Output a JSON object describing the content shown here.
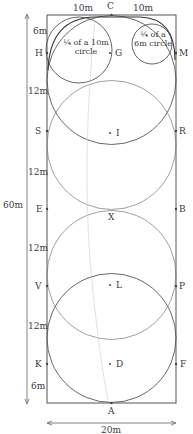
{
  "diagram": {
    "arena": {
      "width_label": "20m",
      "length_label": "60m"
    },
    "top_segments": [
      "10m",
      "10m"
    ],
    "segment_labels": [
      "6m",
      "12m",
      "12m",
      "12m",
      "12m",
      "6m"
    ],
    "letters": {
      "C": "C",
      "H": "H",
      "M": "M",
      "G": "G",
      "S": "S",
      "R": "R",
      "I": "I",
      "E": "E",
      "B": "B",
      "X": "X",
      "V": "V",
      "P": "P",
      "L": "L",
      "K": "K",
      "F": "F",
      "D": "D",
      "A": "A"
    },
    "notes": {
      "ten_m_circle": [
        "¼ of a 10m",
        "circle"
      ],
      "six_m_circle": [
        "¼ of a",
        "6m circle"
      ]
    },
    "colors": {
      "line": "#444444",
      "faint": "#bbbbbb"
    }
  }
}
